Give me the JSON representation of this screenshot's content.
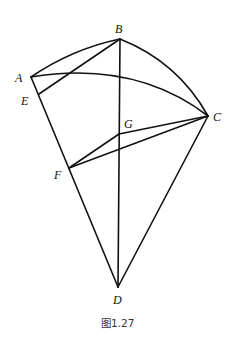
{
  "figure": {
    "caption": "图1.27",
    "points": {
      "A": {
        "label": "A",
        "x": 31,
        "y": 77
      },
      "B": {
        "label": "B",
        "x": 120,
        "y": 39
      },
      "C": {
        "label": "C",
        "x": 208,
        "y": 116
      },
      "D": {
        "label": "D",
        "x": 118,
        "y": 287
      },
      "E": {
        "label": "E",
        "x": 39,
        "y": 94
      },
      "F": {
        "label": "F",
        "x": 69,
        "y": 168
      },
      "G": {
        "label": "G",
        "x": 119,
        "y": 134
      }
    },
    "arcs": [
      "AB",
      "BC",
      "AC"
    ],
    "segments": [
      "BE",
      "BD",
      "AD",
      "CD",
      "GF",
      "GC",
      "FC"
    ],
    "colors": {
      "stroke": "#111111",
      "background": "#ffffff"
    }
  }
}
